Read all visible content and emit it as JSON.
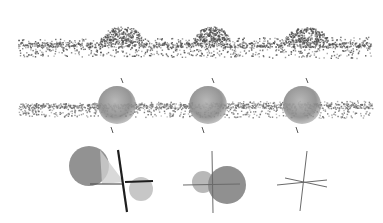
{
  "figure": {
    "background": "#ffffff",
    "rows": [
      {
        "id": "point-cloud-row",
        "description": "surface point cloud with three bumps",
        "strip": {
          "x0": 18,
          "x1": 372,
          "y_top": 36,
          "y_mid": 44,
          "y_bot": 58
        },
        "bumps": [
          {
            "cx": 122,
            "cy": 30,
            "rx": 22,
            "ry": 16
          },
          {
            "cx": 212,
            "cy": 30,
            "rx": 18,
            "ry": 16
          },
          {
            "cx": 306,
            "cy": 30,
            "rx": 22,
            "ry": 15
          }
        ],
        "point_color": "#505050"
      },
      {
        "id": "fitted-spheres-row",
        "description": "point cloud with fitted spheres and axes",
        "strip": {
          "x0": 18,
          "x1": 372,
          "y_top": 28,
          "y_mid": 33,
          "y_bot": 46
        },
        "spheres": [
          {
            "cx": 117,
            "cy": 33,
            "r": 19
          },
          {
            "cx": 208,
            "cy": 33,
            "r": 19
          },
          {
            "cx": 302,
            "cy": 33,
            "r": 19
          }
        ],
        "sphere_color": "#8a8a8a",
        "point_color": "#6a6a6a"
      },
      {
        "id": "glyph-row",
        "description": "orientation glyphs",
        "glyphs": [
          {
            "id": "glyph-1",
            "lobes": [
              {
                "cx": 89,
                "cy": 28,
                "r": 20,
                "color": "#8c8c8c"
              },
              {
                "cx": 141,
                "cy": 51,
                "r": 12,
                "color": "#c4c4c4"
              }
            ],
            "axes": [
              {
                "x1": 118,
                "y1": 12,
                "x2": 127,
                "y2": 74,
                "w": 2.2,
                "color": "#1e1e1e"
              },
              {
                "x1": 90,
                "y1": 46,
                "x2": 122,
                "y2": 46,
                "w": 1.2,
                "color": "#555555"
              },
              {
                "x1": 125,
                "y1": 44,
                "x2": 153,
                "y2": 43,
                "w": 2.2,
                "color": "#1e1e1e"
              }
            ]
          },
          {
            "id": "glyph-2",
            "lobes": [
              {
                "cx": 203,
                "cy": 44,
                "r": 11,
                "color": "#b4b4b4"
              },
              {
                "cx": 227,
                "cy": 47,
                "r": 19,
                "color": "#8a8a8a"
              }
            ],
            "axes": [
              {
                "x1": 212,
                "y1": 13,
                "x2": 213,
                "y2": 75,
                "w": 1,
                "color": "#6a6a6a"
              },
              {
                "x1": 183,
                "y1": 47,
                "x2": 240,
                "y2": 46,
                "w": 1,
                "color": "#6a6a6a"
              }
            ]
          },
          {
            "id": "glyph-3",
            "lobes": [],
            "axes": [
              {
                "x1": 307,
                "y1": 13,
                "x2": 300,
                "y2": 73,
                "w": 1,
                "color": "#6a6a6a"
              },
              {
                "x1": 277,
                "y1": 47,
                "x2": 327,
                "y2": 42,
                "w": 1,
                "color": "#6a6a6a"
              },
              {
                "x1": 285,
                "y1": 40,
                "x2": 327,
                "y2": 49,
                "w": 1,
                "color": "#6a6a6a"
              }
            ]
          }
        ]
      }
    ]
  }
}
